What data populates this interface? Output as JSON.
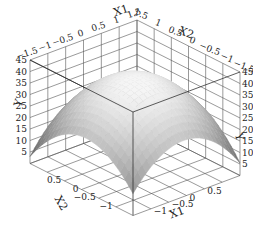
{
  "chart_data": {
    "type": "surface3d",
    "title": "",
    "function": "concave paraboloid peaking near X1=0, X2=0",
    "axes": {
      "x1": {
        "label": "X1",
        "ticks": [
          -1.5,
          -1,
          -0.5,
          0,
          0.5,
          1,
          1.5
        ],
        "tick_labels": [
          "-1.5",
          "-1",
          "-0.5",
          "0",
          "0.5",
          "1",
          "1.5"
        ],
        "range": [
          -1.5,
          1.5
        ]
      },
      "x2": {
        "label": "X2",
        "ticks": [
          -1.5,
          -1,
          -0.5,
          0,
          0.5,
          1,
          1.5
        ],
        "tick_labels": [
          "-1.5",
          "-1",
          "-0.5",
          "0",
          "0.5",
          "1",
          "1.5"
        ],
        "range": [
          -1.5,
          1.5
        ]
      },
      "y": {
        "label": "Y",
        "ticks": [
          5,
          10,
          15,
          20,
          25,
          30,
          35,
          40,
          45
        ],
        "tick_labels": [
          "5",
          "10",
          "15",
          "20",
          "25",
          "30",
          "35",
          "40",
          "45"
        ],
        "range": [
          0,
          45
        ]
      }
    },
    "surface": {
      "peak": {
        "x1": 0,
        "x2": 0,
        "y": 40
      },
      "corner_values": {
        "x1_-1.5_x2_-1.5": 5,
        "x1_1.5_x2_1.5": 5,
        "x1_-1.5_x2_1.5": 20,
        "x1_1.5_x2_-1.5": 12
      },
      "colormap": "grayscale, lighter at top",
      "sample_grid": {
        "x1": [
          -1.5,
          -1,
          -0.5,
          0,
          0.5,
          1,
          1.5
        ],
        "x2": [
          -1.5,
          -1,
          -0.5,
          0,
          0.5,
          1,
          1.5
        ],
        "y": [
          [
            5,
            14,
            20,
            22,
            20,
            14,
            5
          ],
          [
            14,
            23,
            29,
            31,
            29,
            23,
            14
          ],
          [
            20,
            29,
            35,
            37,
            35,
            29,
            20
          ],
          [
            22,
            31,
            37,
            40,
            37,
            31,
            22
          ],
          [
            20,
            29,
            35,
            37,
            35,
            29,
            20
          ],
          [
            14,
            23,
            29,
            31,
            29,
            23,
            14
          ],
          [
            5,
            14,
            20,
            22,
            20,
            14,
            5
          ]
        ]
      }
    },
    "grid": true,
    "legend": null,
    "extra_labels": [
      "1.0",
      "15",
      "5"
    ]
  }
}
